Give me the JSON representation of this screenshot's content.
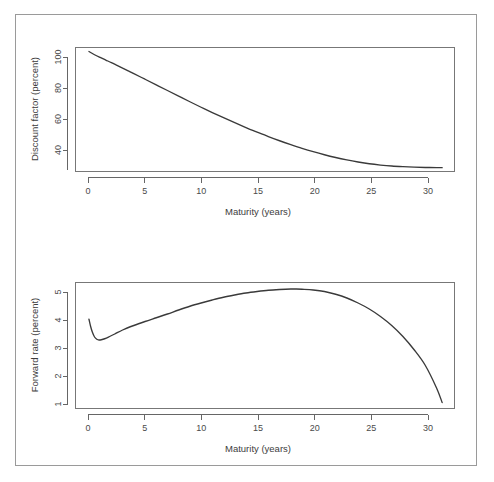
{
  "figure": {
    "background_color": "#ffffff",
    "frame_color": "#9a9a9a",
    "curve_color": "#3a3a3a",
    "axis_color": "#666666"
  },
  "chart_data": [
    {
      "type": "line",
      "id": "discount-factor",
      "title": "",
      "xlabel": "Maturity (years)",
      "ylabel": "Discount factor (percent)",
      "xlim": [
        -1.2,
        32.6
      ],
      "ylim": [
        25.5,
        102.5
      ],
      "xticks": [
        0,
        5,
        10,
        15,
        20,
        25,
        30
      ],
      "xtick_labels": [
        "0",
        "5",
        "10",
        "15",
        "20",
        "25",
        "30"
      ],
      "yticks": [
        40,
        60,
        80,
        100
      ],
      "ytick_labels": [
        "40",
        "60",
        "80",
        "100"
      ],
      "grid": false,
      "legend": null,
      "series": [
        {
          "name": "Discount factor",
          "x": [
            0.0,
            0.5,
            1.0,
            1.5,
            2.0,
            2.5,
            3.0,
            3.5,
            4.0,
            5.0,
            6.0,
            7.0,
            8.0,
            9.0,
            10.0,
            11.0,
            12.0,
            13.0,
            14.0,
            15.0,
            16.0,
            17.0,
            18.0,
            19.0,
            20.0,
            21.0,
            22.0,
            23.0,
            24.0,
            25.0,
            26.0,
            27.0,
            28.0,
            29.0,
            30.0,
            31.0,
            31.5
          ],
          "values": [
            100.0,
            98.0,
            96.3,
            94.7,
            93.1,
            91.4,
            89.7,
            88.0,
            86.3,
            82.8,
            79.3,
            75.8,
            72.3,
            68.8,
            65.4,
            62.1,
            58.9,
            55.8,
            52.8,
            49.9,
            47.2,
            44.6,
            42.2,
            39.9,
            37.8,
            35.9,
            34.2,
            32.7,
            31.4,
            30.3,
            29.5,
            28.9,
            28.5,
            28.2,
            28.0,
            27.9,
            27.9
          ]
        }
      ]
    },
    {
      "type": "line",
      "id": "forward-rate",
      "title": "",
      "xlabel": "Maturity (years)",
      "ylabel": "Forward rate (percent)",
      "xlim": [
        -1.2,
        32.6
      ],
      "ylim": [
        0.58,
        5.62
      ],
      "xticks": [
        0,
        5,
        10,
        15,
        20,
        25,
        30
      ],
      "xtick_labels": [
        "0",
        "5",
        "10",
        "15",
        "20",
        "25",
        "30"
      ],
      "yticks": [
        1,
        2,
        3,
        4,
        5
      ],
      "ytick_labels": [
        "1",
        "2",
        "3",
        "4",
        "5"
      ],
      "grid": false,
      "legend": null,
      "series": [
        {
          "name": "Forward rate",
          "x": [
            0.0,
            0.15,
            0.3,
            0.5,
            0.7,
            0.9,
            1.1,
            1.4,
            1.8,
            2.3,
            3.0,
            4.0,
            5.0,
            6.0,
            7.0,
            8.0,
            9.0,
            10.0,
            11.0,
            12.0,
            13.0,
            14.0,
            15.0,
            16.0,
            17.0,
            18.0,
            18.5,
            19.0,
            20.0,
            21.0,
            22.0,
            23.0,
            24.0,
            25.0,
            26.0,
            27.0,
            28.0,
            29.0,
            30.0,
            31.0,
            31.5
          ],
          "values": [
            4.15,
            3.86,
            3.64,
            3.44,
            3.35,
            3.32,
            3.33,
            3.37,
            3.45,
            3.56,
            3.72,
            3.9,
            4.06,
            4.21,
            4.36,
            4.52,
            4.67,
            4.8,
            4.92,
            5.03,
            5.12,
            5.2,
            5.26,
            5.31,
            5.34,
            5.36,
            5.36,
            5.35,
            5.32,
            5.26,
            5.15,
            5.0,
            4.8,
            4.56,
            4.26,
            3.9,
            3.46,
            2.93,
            2.3,
            1.4,
            0.82
          ]
        }
      ]
    }
  ]
}
